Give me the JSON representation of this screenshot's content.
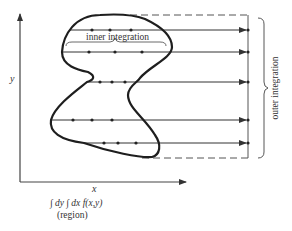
{
  "diagram": {
    "labels": {
      "y_axis": "y",
      "x_axis": "x",
      "inner": "inner integration",
      "outer": "outer integration",
      "formula": "∫ dy ∫ dx f(x,y)",
      "region": "(region)"
    },
    "colors": {
      "ink": "#2a2a2a",
      "region": "#1e1e1e",
      "guide": "#555555"
    },
    "integration_lines": [
      {
        "name": "line-1",
        "inside_points": 3
      },
      {
        "name": "line-2",
        "inside_points": 3
      },
      {
        "name": "line-3",
        "inside_points": 3
      },
      {
        "name": "line-4",
        "inside_points": 3
      },
      {
        "name": "line-5",
        "inside_points": 3
      }
    ]
  }
}
